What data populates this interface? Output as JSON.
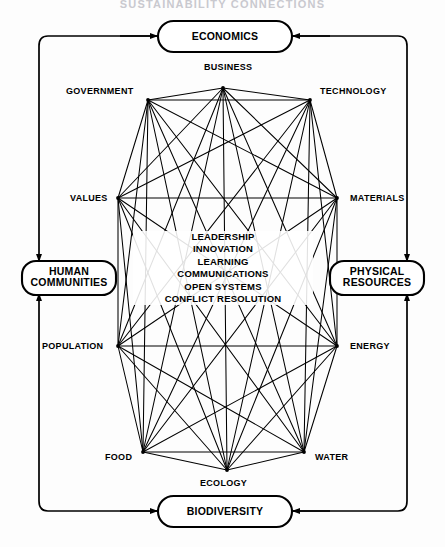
{
  "page": {
    "title_banner": "SUSTAINABILITY CONNECTIONS"
  },
  "outer_boxes": [
    {
      "id": "economics",
      "label": "ECONOMICS",
      "lines": [
        "ECONOMICS"
      ],
      "position": "top"
    },
    {
      "id": "human-communities",
      "label": "HUMAN COMMUNITIES",
      "lines": [
        "HUMAN",
        "COMMUNITIES"
      ],
      "position": "left"
    },
    {
      "id": "physical-resources",
      "label": "PHYSICAL RESOURCES",
      "lines": [
        "PHYSICAL",
        "RESOURCES"
      ],
      "position": "right"
    },
    {
      "id": "biodiversity",
      "label": "BIODIVERSITY",
      "lines": [
        "BIODIVERSITY"
      ],
      "position": "bottom"
    }
  ],
  "network_nodes": [
    {
      "id": "business",
      "label": "BUSINESS",
      "x": 223,
      "y": 88,
      "label_x": 204,
      "label_y": 62,
      "anchor": "left"
    },
    {
      "id": "technology",
      "label": "TECHNOLOGY",
      "x": 310,
      "y": 100,
      "label_x": 320,
      "label_y": 86,
      "anchor": "left"
    },
    {
      "id": "materials",
      "label": "MATERIALS",
      "x": 337,
      "y": 198,
      "label_x": 350,
      "label_y": 193,
      "anchor": "left"
    },
    {
      "id": "energy",
      "label": "ENERGY",
      "x": 337,
      "y": 346,
      "label_x": 350,
      "label_y": 341,
      "anchor": "left"
    },
    {
      "id": "water",
      "label": "WATER",
      "x": 304,
      "y": 452,
      "label_x": 315,
      "label_y": 452,
      "anchor": "left"
    },
    {
      "id": "ecology",
      "label": "ECOLOGY",
      "x": 227,
      "y": 470,
      "label_x": 200,
      "label_y": 478,
      "anchor": "left"
    },
    {
      "id": "food",
      "label": "FOOD",
      "x": 143,
      "y": 452,
      "label_x": 105,
      "label_y": 452,
      "anchor": "left"
    },
    {
      "id": "population",
      "label": "POPULATION",
      "x": 118,
      "y": 346,
      "label_x": 42,
      "label_y": 341,
      "anchor": "left"
    },
    {
      "id": "values",
      "label": "VALUES",
      "x": 118,
      "y": 198,
      "label_x": 70,
      "label_y": 193,
      "anchor": "left"
    },
    {
      "id": "government",
      "label": "GOVERNMENT",
      "x": 148,
      "y": 100,
      "label_x": 66,
      "label_y": 86,
      "anchor": "left"
    }
  ],
  "center_concepts": [
    "LEADERSHIP",
    "INNOVATION",
    "LEARNING",
    "COMMUNICATIONS",
    "OPEN SYSTEMS",
    "CONFLICT RESOLUTION"
  ],
  "colors": {
    "stroke": "#000000",
    "background": "#fdfdfd",
    "title": "#c9c9cf"
  }
}
